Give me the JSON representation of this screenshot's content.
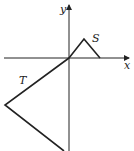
{
  "diagram": {
    "axes": {
      "x_label": "x",
      "y_label": "y"
    },
    "shapes": [
      {
        "name": "S",
        "label": "S",
        "points": [
          [
            69,
            58
          ],
          [
            84,
            39
          ],
          [
            100,
            58
          ]
        ]
      },
      {
        "name": "T",
        "label": "T",
        "points": [
          [
            69,
            58
          ],
          [
            5,
            105
          ],
          [
            64,
            151
          ]
        ]
      }
    ],
    "colors": {
      "stroke": "#222222",
      "background": "#ffffff"
    }
  }
}
